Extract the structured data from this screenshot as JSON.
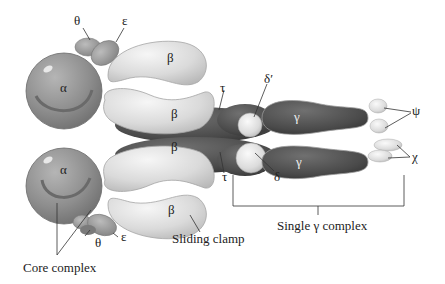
{
  "figure": {
    "colors": {
      "alpha": "#8e8e8e",
      "beta": "#d9d9d9",
      "tau_dark": "#4a4a4a",
      "gamma": "#505050",
      "delta": "#e2e2e2",
      "theta_epsilon": "#9a9a9a",
      "psi_chi": "#d0d0d0",
      "line": "#333333",
      "background": "#ffffff"
    }
  },
  "labels": {
    "theta_top": "θ",
    "epsilon_top": "ε",
    "beta_top_outer": "β",
    "beta_top_inner": "β",
    "alpha_top": "α",
    "alpha_bottom": "α",
    "beta_bottom_inner": "β",
    "beta_bottom_outer": "β",
    "tau_top": "τ",
    "tau_bottom": "τ",
    "delta_prime": "δ′",
    "delta": "δ",
    "gamma_top": "γ",
    "gamma_bottom": "γ",
    "psi": "ψ",
    "chi": "χ",
    "theta_bottom": "θ",
    "epsilon_bottom": "ε",
    "sliding_clamp": "Sliding clamp",
    "single_gamma_complex": "Single γ complex",
    "core_complex": "Core complex"
  }
}
